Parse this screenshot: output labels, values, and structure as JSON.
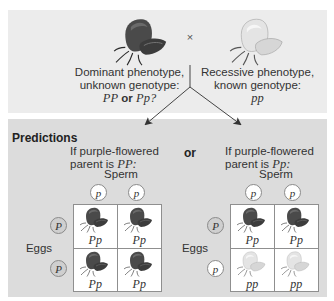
{
  "cross": {
    "symbol": "×",
    "left_parent": {
      "flower_icon": "purple-flower",
      "line1": "Dominant phenotype,",
      "line2": "unknown genotype:",
      "genotype_a": "PP",
      "or_word": "or",
      "genotype_b": "Pp?"
    },
    "right_parent": {
      "flower_icon": "white-flower",
      "line1": "Recessive phenotype,",
      "line2": "known genotype:",
      "genotype": "pp"
    }
  },
  "predictions": {
    "title": "Predictions",
    "or_label": "or",
    "scenarios": [
      {
        "line1": "If purple-flowered",
        "line2_prefix": "parent is ",
        "line2_genotype": "PP:",
        "sperm_label": "Sperm",
        "eggs_label": "Eggs",
        "sperm_alleles": [
          "p",
          "p"
        ],
        "egg_alleles": [
          "P",
          "P"
        ],
        "offspring": [
          {
            "genotype": "Pp",
            "phenotype": "purple"
          },
          {
            "genotype": "Pp",
            "phenotype": "purple"
          },
          {
            "genotype": "Pp",
            "phenotype": "purple"
          },
          {
            "genotype": "Pp",
            "phenotype": "purple"
          }
        ]
      },
      {
        "line1": "If purple-flowered",
        "line2_prefix": "parent is ",
        "line2_genotype": "Pp:",
        "sperm_label": "Sperm",
        "eggs_label": "Eggs",
        "sperm_alleles": [
          "p",
          "p"
        ],
        "egg_alleles": [
          "P",
          "p"
        ],
        "offspring": [
          {
            "genotype": "Pp",
            "phenotype": "purple"
          },
          {
            "genotype": "Pp",
            "phenotype": "purple"
          },
          {
            "genotype": "pp",
            "phenotype": "white"
          },
          {
            "genotype": "pp",
            "phenotype": "white"
          }
        ]
      }
    ]
  },
  "colors": {
    "top_panel": "#ececec",
    "bottom_panel": "#dcdcdc",
    "purple_flower": "#4a4a4a",
    "white_flower": "#e6e6e6",
    "dominant_allele_circle": "#cfcfcf",
    "recessive_allele_circle": "#ffffff"
  }
}
